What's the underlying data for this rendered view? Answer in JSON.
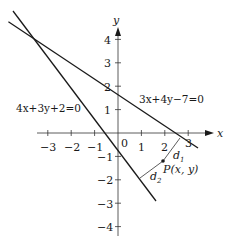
{
  "diagram": {
    "type": "coordinate-plane",
    "axes": {
      "x_label": "x",
      "y_label": "y",
      "x_ticks": [
        "−3",
        "−2",
        "−1",
        "0",
        "1",
        "2",
        "3"
      ],
      "y_ticks_pos": [
        "4",
        "3",
        "2",
        "1"
      ],
      "y_ticks_neg": [
        "−1",
        "−2",
        "−3",
        "−4"
      ]
    },
    "lines": [
      {
        "label": "3x+4y−7=0",
        "equation": "3x+4y-7=0"
      },
      {
        "label": "4x+3y+2=0",
        "equation": "4x+3y+2=0"
      }
    ],
    "point": {
      "label": "P(x, y)"
    },
    "distances": [
      {
        "label": "d",
        "sub": "1"
      },
      {
        "label": "d",
        "sub": "2"
      }
    ],
    "colors": {
      "ink": "#1a1a1a",
      "thin": "#333333"
    }
  }
}
